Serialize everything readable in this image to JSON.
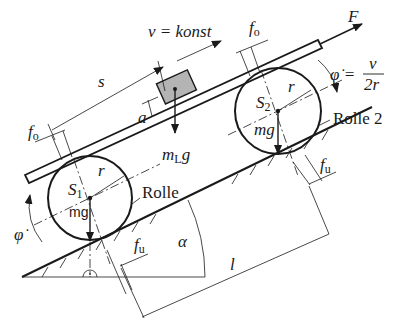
{
  "diagram": {
    "labels": {
      "velocity": "v = konst",
      "force": "F",
      "phi_dot_eq_lhs": "φ̇ =",
      "phi_dot_num": "v",
      "phi_dot_den": "2r",
      "phi_dot": "φ̇",
      "s": "s",
      "a": "a",
      "f_o_left": "f",
      "f_o_left_sub": "o",
      "f_o_right": "f",
      "f_o_right_sub": "o",
      "f_u_left": "f",
      "f_u_left_sub": "u",
      "f_u_right": "f",
      "f_u_right_sub": "u",
      "load_weight": "m",
      "load_weight_sub": "L",
      "load_weight_g": "g",
      "s1": "S",
      "s1_sub": "1",
      "s2": "S",
      "s2_sub": "2",
      "r1": "r",
      "r2": "r",
      "mg1": "mg",
      "mg2": "mg",
      "roller1": "Rolle",
      "roller2": "Rolle 2",
      "alpha": "α",
      "l": "l"
    },
    "colors": {
      "line": "#1a1a1a",
      "block_fill": "#b4b4b4",
      "background": "#ffffff"
    },
    "geometry": {
      "incline_angle_deg": 26
    }
  }
}
